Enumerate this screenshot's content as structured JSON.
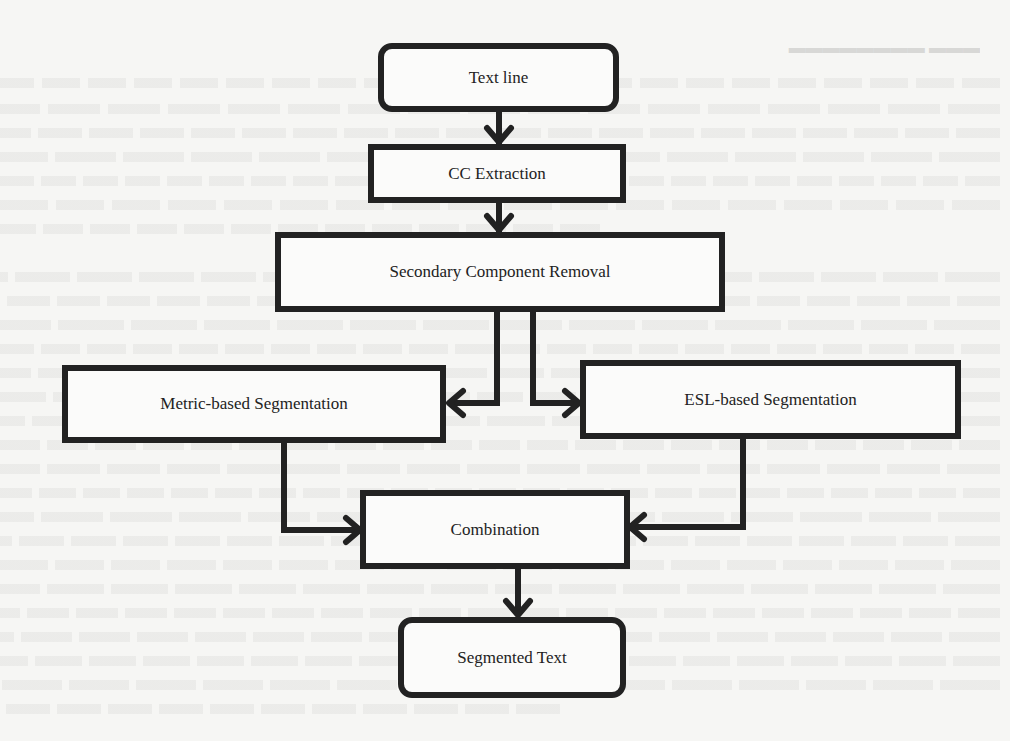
{
  "diagram": {
    "type": "flowchart",
    "nodes": [
      {
        "id": "text-line",
        "label": "Text line",
        "shape": "rounded-rect"
      },
      {
        "id": "cc-extraction",
        "label": "CC Extraction",
        "shape": "rect"
      },
      {
        "id": "secondary-component-removal",
        "label": "Secondary Component Removal",
        "shape": "rect"
      },
      {
        "id": "metric-based-segmentation",
        "label": "Metric-based Segmentation",
        "shape": "rect"
      },
      {
        "id": "esl-based-segmentation",
        "label": "ESL-based Segmentation",
        "shape": "rect"
      },
      {
        "id": "combination",
        "label": "Combination",
        "shape": "rect"
      },
      {
        "id": "segmented-text",
        "label": "Segmented Text",
        "shape": "rounded-rect"
      }
    ],
    "edges": [
      {
        "from": "text-line",
        "to": "cc-extraction"
      },
      {
        "from": "cc-extraction",
        "to": "secondary-component-removal"
      },
      {
        "from": "secondary-component-removal",
        "to": "metric-based-segmentation"
      },
      {
        "from": "secondary-component-removal",
        "to": "esl-based-segmentation"
      },
      {
        "from": "metric-based-segmentation",
        "to": "combination"
      },
      {
        "from": "esl-based-segmentation",
        "to": "combination"
      },
      {
        "from": "combination",
        "to": "segmented-text"
      }
    ],
    "colors": {
      "stroke": "#222222",
      "node_fill": "#fbfbfa",
      "background": "#f6f6f4"
    }
  }
}
